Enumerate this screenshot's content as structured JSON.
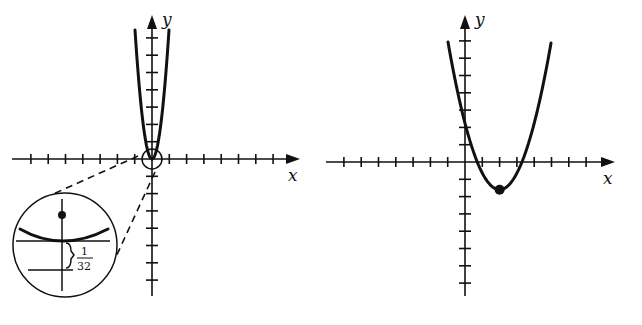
{
  "figure": {
    "left_graph": {
      "title": "",
      "x_label": "x",
      "y_label": "y",
      "origin_px": [
        152,
        159
      ],
      "tick_spacing_px": 17.3,
      "x_ticks": [
        -7,
        -6,
        -5,
        -4,
        -3,
        -2,
        -1,
        1,
        2,
        3,
        4,
        5,
        6,
        7
      ],
      "y_ticks_up": [
        1,
        2,
        3,
        4,
        5,
        6,
        7
      ],
      "y_ticks_down": [
        -1,
        -2,
        -3,
        -4,
        -5,
        -6,
        -7
      ],
      "x_axis_px": [
        12,
        300
      ],
      "y_axis_px": [
        15,
        296
      ],
      "curve": "narrow upward parabola with vertex near origin",
      "vertex_marker": "small circle around origin",
      "inset": {
        "center_px": [
          65,
          245
        ],
        "radius_px": 52,
        "description": "magnified view showing focus point above a flat parabola vertex and directrix below",
        "gap_label_num": "1",
        "gap_label_den": "32",
        "gap_meaning": "distance from vertex to directrix is 1/32"
      }
    },
    "right_graph": {
      "title": "",
      "x_label": "x",
      "y_label": "y",
      "origin_px": [
        465,
        162
      ],
      "tick_spacing_px": 17.3,
      "x_ticks": [
        -7,
        -6,
        -5,
        -4,
        -3,
        -2,
        -1,
        1,
        2,
        3,
        4,
        5,
        6,
        7
      ],
      "y_ticks_up": [
        1,
        2,
        3,
        4,
        5,
        6,
        7
      ],
      "y_ticks_down": [
        -1,
        -2,
        -3,
        -4,
        -5,
        -6,
        -7
      ],
      "x_axis_px": [
        326,
        615
      ],
      "y_axis_px": [
        15,
        296
      ],
      "curve": "upward parabola with vertex at about (2, -1.6)",
      "vertex": [
        2,
        -1.6
      ],
      "vertex_marker": "filled dot"
    }
  },
  "chart_data": [
    {
      "type": "line",
      "title": "",
      "xlabel": "x",
      "ylabel": "y",
      "description": "Very narrow parabola y = 16x^2 (approx) through origin; inset magnifies vertex showing focus above and directrix 1/32 below",
      "series": [
        {
          "name": "parabola",
          "x": [
            -1,
            -0.5,
            0,
            0.5,
            1
          ],
          "y": [
            7.4,
            1.85,
            0,
            1.85,
            7.4
          ]
        }
      ],
      "xlim": [
        -8,
        8
      ],
      "ylim": [
        -8,
        8
      ],
      "annotations": [
        "1/32"
      ]
    },
    {
      "type": "line",
      "title": "",
      "xlabel": "x",
      "ylabel": "y",
      "description": "Upward parabola with vertex at about (2, -1.6), crossing x-axis near x≈0.6 and x≈3.4, y-intercept ≈ 3",
      "series": [
        {
          "name": "parabola",
          "x": [
            -1,
            0,
            1,
            2,
            3,
            4,
            5
          ],
          "y": [
            7,
            2.9,
            -0.6,
            -1.6,
            -0.6,
            2.9,
            7
          ]
        }
      ],
      "xlim": [
        -8,
        8
      ],
      "ylim": [
        -8,
        8
      ],
      "vertex": [
        2,
        -1.6
      ]
    }
  ]
}
